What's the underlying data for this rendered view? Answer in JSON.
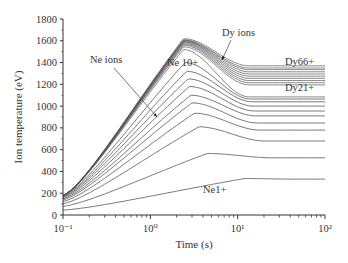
{
  "chart_data": {
    "type": "line",
    "title": "",
    "xlabel": "Time (s)",
    "ylabel": "Ion temperature (eV)",
    "xscale": "log",
    "xlim": [
      0.1,
      100
    ],
    "ylim": [
      0,
      1800
    ],
    "x_ticks": [
      "10⁻¹",
      "10⁰",
      "10¹",
      "10²"
    ],
    "x_tick_values": [
      0.1,
      1,
      10,
      100
    ],
    "y_ticks": [
      0,
      200,
      400,
      600,
      800,
      1000,
      1200,
      1400,
      1600,
      1800
    ],
    "grid": false,
    "legend": "none",
    "annotations": [
      {
        "text": "Ne ions",
        "x_px": 90,
        "y_px": 63,
        "arrow_from": [
          114,
          68
        ],
        "arrow_to": [
          157,
          117
        ]
      },
      {
        "text": "Dy ions",
        "x_px": 222,
        "y_px": 36,
        "arrow_from": [
          231,
          40
        ],
        "arrow_to": [
          222,
          60
        ]
      },
      {
        "text": "Ne 10+",
        "x_px": 167,
        "y_px": 66
      },
      {
        "text": "Dy66+",
        "x_px": 285,
        "y_px": 65
      },
      {
        "text": "Dy21+",
        "x_px": 285,
        "y_px": 91
      },
      {
        "text": "Ne1+",
        "x_px": 203,
        "y_px": 193
      }
    ],
    "series_model": "Each curve: T0 at t=0.1 s, peak Tp at tp (s), settling to Te by ~10 s",
    "series": [
      {
        "name": "Ne1+",
        "T0": 45,
        "Tp": 335,
        "tp": 12,
        "Te": 330
      },
      {
        "name": "Ne2+",
        "T0": 80,
        "Tp": 565,
        "tp": 4.5,
        "Te": 525
      },
      {
        "name": "Ne3+",
        "T0": 105,
        "Tp": 810,
        "tp": 3.6,
        "Te": 680
      },
      {
        "name": "Ne4+",
        "T0": 125,
        "Tp": 935,
        "tp": 3.2,
        "Te": 780
      },
      {
        "name": "Ne5+",
        "T0": 140,
        "Tp": 1030,
        "tp": 3.0,
        "Te": 845
      },
      {
        "name": "Ne6+",
        "T0": 150,
        "Tp": 1100,
        "tp": 2.9,
        "Te": 910
      },
      {
        "name": "Ne7+",
        "T0": 160,
        "Tp": 1180,
        "tp": 2.8,
        "Te": 955
      },
      {
        "name": "Ne8+",
        "T0": 168,
        "Tp": 1250,
        "tp": 2.7,
        "Te": 1000
      },
      {
        "name": "Ne9+",
        "T0": 173,
        "Tp": 1320,
        "tp": 2.6,
        "Te": 1040
      },
      {
        "name": "Ne10+",
        "T0": 178,
        "Tp": 1400,
        "tp": 2.5,
        "Te": 1065
      },
      {
        "name": "Dy21+",
        "T0": 180,
        "Tp": 1520,
        "tp": 2.4,
        "Te": 1085
      },
      {
        "name": "Dy25+",
        "T0": 180,
        "Tp": 1545,
        "tp": 2.4,
        "Te": 1195
      },
      {
        "name": "Dy30+",
        "T0": 180,
        "Tp": 1560,
        "tp": 2.4,
        "Te": 1215
      },
      {
        "name": "Dy35+",
        "T0": 180,
        "Tp": 1570,
        "tp": 2.4,
        "Te": 1235
      },
      {
        "name": "Dy40+",
        "T0": 180,
        "Tp": 1580,
        "tp": 2.4,
        "Te": 1255
      },
      {
        "name": "Dy45+",
        "T0": 180,
        "Tp": 1588,
        "tp": 2.4,
        "Te": 1275
      },
      {
        "name": "Dy50+",
        "T0": 180,
        "Tp": 1595,
        "tp": 2.4,
        "Te": 1295
      },
      {
        "name": "Dy55+",
        "T0": 180,
        "Tp": 1600,
        "tp": 2.4,
        "Te": 1315
      },
      {
        "name": "Dy60+",
        "T0": 180,
        "Tp": 1605,
        "tp": 2.4,
        "Te": 1335
      },
      {
        "name": "Dy63+",
        "T0": 180,
        "Tp": 1610,
        "tp": 2.4,
        "Te": 1350
      },
      {
        "name": "Dy66+",
        "T0": 180,
        "Tp": 1620,
        "tp": 2.4,
        "Te": 1370
      }
    ],
    "colors": {
      "line": "#555555",
      "axis": "#333333",
      "text": "#333333",
      "background": "#ffffff"
    }
  }
}
